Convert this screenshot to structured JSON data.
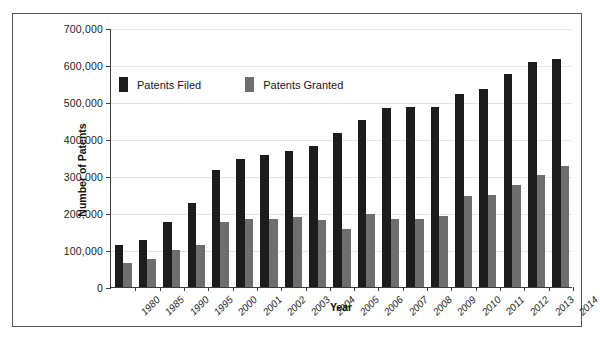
{
  "chart_data": {
    "type": "bar",
    "title": "",
    "xlabel": "Year",
    "ylabel": "Number of Patents",
    "categories": [
      "1980",
      "1985",
      "1990",
      "1995",
      "2000",
      "2001",
      "2002",
      "2003",
      "2004",
      "2005",
      "2006",
      "2007",
      "2008",
      "2009",
      "2010",
      "2011",
      "2012",
      "2013",
      "2014"
    ],
    "series": [
      {
        "name": "Patents Filed",
        "color": "#1c1c1c",
        "values": [
          113000,
          127000,
          177000,
          228000,
          316000,
          345000,
          357000,
          367000,
          382000,
          417000,
          452000,
          485000,
          486000,
          486000,
          521000,
          536000,
          577000,
          607000,
          615000
        ]
      },
      {
        "name": "Patents Granted",
        "color": "#6e6e6e",
        "values": [
          66000,
          77000,
          100000,
          114000,
          176000,
          184000,
          185000,
          188000,
          182000,
          158000,
          196000,
          184000,
          185000,
          191000,
          245000,
          250000,
          277000,
          303000,
          327000
        ]
      }
    ],
    "ylim": [
      0,
      700000
    ],
    "yticks": [
      0,
      100000,
      200000,
      300000,
      400000,
      500000,
      600000,
      700000
    ],
    "ytick_labels": [
      "0",
      "100,000",
      "200,000",
      "300,000",
      "400,000",
      "500,000",
      "600,000",
      "700,000"
    ],
    "grid": true,
    "legend_position": "upper-left-inside"
  },
  "legend": {
    "entries": [
      {
        "label": "Patents Filed",
        "swatch": "filed"
      },
      {
        "label": "Patents Granted",
        "swatch": "granted"
      }
    ]
  }
}
